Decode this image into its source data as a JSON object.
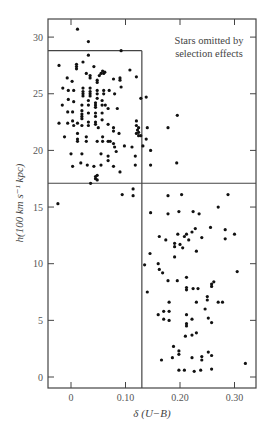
{
  "chart_data": {
    "type": "scatter",
    "title": "",
    "xlabel": "δ (U−B)",
    "ylabel": "h(100 km s⁻¹ kpc)",
    "xlim": [
      -0.042,
      0.34
    ],
    "ylim": [
      -1.0,
      31.6
    ],
    "xticks": [
      0,
      0.1,
      0.2,
      0.3
    ],
    "xtick_labels": [
      "0",
      "0.10",
      "0.20",
      "0.30"
    ],
    "yticks": [
      0,
      5,
      10,
      15,
      20,
      25,
      30
    ],
    "ytick_labels": [
      "0",
      "5",
      "10",
      "15",
      "20",
      "25",
      "30"
    ],
    "grid": false,
    "annotation": [
      "Stars omitted by",
      "selection effects"
    ],
    "boundary_lines": {
      "vertical_x": 0.13,
      "horizontal_y_mid": 17.1,
      "horizontal_y_top": 28.8,
      "top_line_extent_x": [
        -0.042,
        0.13
      ]
    },
    "points": [
      [
        0.012,
        30.7
      ],
      [
        0.032,
        29.6
      ],
      [
        0.032,
        28.4
      ],
      [
        0.092,
        28.8
      ],
      [
        -0.022,
        27.5
      ],
      [
        0.01,
        27.4
      ],
      [
        0.01,
        27.2
      ],
      [
        0.01,
        27.6
      ],
      [
        0.022,
        27.8
      ],
      [
        0.042,
        27.4
      ],
      [
        0.028,
        26.8
      ],
      [
        0.035,
        26.6
      ],
      [
        0.035,
        26.4
      ],
      [
        0.048,
        26.2
      ],
      [
        0.048,
        26.0
      ],
      [
        0.052,
        26.6
      ],
      [
        0.055,
        26.8
      ],
      [
        0.058,
        27.0
      ],
      [
        0.06,
        26.8
      ],
      [
        0.062,
        26.9
      ],
      [
        0.078,
        26.3
      ],
      [
        0.09,
        26.4
      ],
      [
        0.09,
        26.2
      ],
      [
        0.108,
        27.1
      ],
      [
        0.12,
        26.5
      ],
      [
        -0.007,
        26.4
      ],
      [
        0.002,
        26.1
      ],
      [
        -0.015,
        25.5
      ],
      [
        -0.005,
        25.3
      ],
      [
        0.005,
        25.3
      ],
      [
        0.022,
        25.5
      ],
      [
        0.022,
        25.2
      ],
      [
        0.022,
        25.0
      ],
      [
        0.022,
        24.8
      ],
      [
        0.035,
        25.5
      ],
      [
        0.035,
        25.2
      ],
      [
        0.035,
        25.0
      ],
      [
        0.035,
        24.8
      ],
      [
        0.048,
        25.3
      ],
      [
        0.048,
        25.0
      ],
      [
        0.048,
        24.6
      ],
      [
        0.06,
        25.3
      ],
      [
        0.06,
        25.0
      ],
      [
        0.07,
        25.3
      ],
      [
        0.08,
        25.0
      ],
      [
        0.092,
        25.6
      ],
      [
        0.128,
        24.6
      ],
      [
        0.138,
        24.7
      ],
      [
        -0.005,
        24.5
      ],
      [
        0.005,
        24.3
      ],
      [
        -0.016,
        24.0
      ],
      [
        0.02,
        24.0
      ],
      [
        0.032,
        24.4
      ],
      [
        0.032,
        24.0
      ],
      [
        0.045,
        24.2
      ],
      [
        0.045,
        24.0
      ],
      [
        0.045,
        23.8
      ],
      [
        0.057,
        24.4
      ],
      [
        0.057,
        24.0
      ],
      [
        0.063,
        24.0
      ],
      [
        0.068,
        23.7
      ],
      [
        0.085,
        23.7
      ],
      [
        0.003,
        23.4
      ],
      [
        -0.006,
        23.4
      ],
      [
        0.02,
        23.5
      ],
      [
        0.02,
        23.2
      ],
      [
        0.02,
        23.0
      ],
      [
        0.02,
        22.8
      ],
      [
        0.032,
        23.3
      ],
      [
        0.045,
        23.3
      ],
      [
        0.045,
        23.0
      ],
      [
        0.057,
        23.3
      ],
      [
        0.045,
        22.5
      ],
      [
        0.057,
        22.7
      ],
      [
        -0.022,
        22.4
      ],
      [
        -0.006,
        22.4
      ],
      [
        0.003,
        22.6
      ],
      [
        0.005,
        22.2
      ],
      [
        0.012,
        22.4
      ],
      [
        0.02,
        22.2
      ],
      [
        0.032,
        22.5
      ],
      [
        0.032,
        22.2
      ],
      [
        0.045,
        22.3
      ],
      [
        0.05,
        22.0
      ],
      [
        0.068,
        22.3
      ],
      [
        0.078,
        22.0
      ],
      [
        0.078,
        21.7
      ],
      [
        0.12,
        22.6
      ],
      [
        0.12,
        22.2
      ],
      [
        0.122,
        21.8
      ],
      [
        0.124,
        22.0
      ],
      [
        0.124,
        21.6
      ],
      [
        0.124,
        21.3
      ],
      [
        0.14,
        22.0
      ],
      [
        0.178,
        22.0
      ],
      [
        0.195,
        23.1
      ],
      [
        -0.012,
        21.2
      ],
      [
        0.012,
        21.5
      ],
      [
        0.012,
        21.0
      ],
      [
        0.028,
        21.2
      ],
      [
        0.058,
        21.2
      ],
      [
        0.068,
        20.8
      ],
      [
        0.078,
        20.6
      ],
      [
        0.088,
        21.5
      ],
      [
        0.12,
        21.5
      ],
      [
        0.128,
        21.3
      ],
      [
        0.138,
        21.0
      ],
      [
        0.08,
        20.3
      ],
      [
        0.112,
        20.3
      ],
      [
        0.132,
        20.4
      ],
      [
        0.012,
        20.8
      ],
      [
        0.028,
        20.8
      ],
      [
        0.048,
        20.8
      ],
      [
        0.058,
        20.8
      ],
      [
        0.072,
        20.8
      ],
      [
        0.0,
        19.7
      ],
      [
        0.02,
        19.7
      ],
      [
        0.055,
        19.7
      ],
      [
        0.068,
        19.5
      ],
      [
        0.083,
        19.9
      ],
      [
        0.098,
        20.4
      ],
      [
        0.118,
        19.5
      ],
      [
        0.118,
        18.7
      ],
      [
        0.146,
        20.0
      ],
      [
        0.146,
        18.7
      ],
      [
        0.194,
        18.9
      ],
      [
        0.003,
        18.6
      ],
      [
        0.018,
        18.9
      ],
      [
        0.03,
        18.7
      ],
      [
        0.042,
        18.6
      ],
      [
        0.055,
        18.7
      ],
      [
        0.068,
        19.1
      ],
      [
        0.078,
        18.6
      ],
      [
        0.09,
        18.1
      ],
      [
        0.045,
        17.7
      ],
      [
        0.045,
        17.5
      ],
      [
        0.048,
        17.4
      ],
      [
        0.048,
        17.8
      ],
      [
        0.036,
        17.1
      ],
      [
        0.094,
        16.1
      ],
      [
        0.114,
        16.6
      ],
      [
        0.114,
        16.0
      ],
      [
        -0.024,
        15.3
      ],
      [
        0.203,
        16.1
      ],
      [
        0.178,
        16.0
      ],
      [
        0.146,
        14.5
      ],
      [
        0.178,
        14.4
      ],
      [
        0.198,
        14.6
      ],
      [
        0.224,
        14.6
      ],
      [
        0.235,
        14.4
      ],
      [
        0.27,
        15.0
      ],
      [
        0.288,
        16.1
      ],
      [
        0.162,
        12.4
      ],
      [
        0.174,
        12.1
      ],
      [
        0.19,
        11.8
      ],
      [
        0.19,
        11.5
      ],
      [
        0.196,
        12.6
      ],
      [
        0.208,
        12.4
      ],
      [
        0.212,
        12.6
      ],
      [
        0.216,
        12.1
      ],
      [
        0.222,
        12.8
      ],
      [
        0.228,
        13.1
      ],
      [
        0.24,
        12.3
      ],
      [
        0.256,
        13.2
      ],
      [
        0.283,
        13.0
      ],
      [
        0.283,
        12.2
      ],
      [
        0.3,
        12.6
      ],
      [
        0.2,
        11.7
      ],
      [
        0.23,
        11.1
      ],
      [
        0.205,
        11.4
      ],
      [
        0.145,
        10.9
      ],
      [
        0.135,
        9.9
      ],
      [
        0.16,
        10.0
      ],
      [
        0.162,
        9.5
      ],
      [
        0.168,
        9.2
      ],
      [
        0.178,
        8.5
      ],
      [
        0.19,
        10.6
      ],
      [
        0.195,
        8.5
      ],
      [
        0.212,
        8.8
      ],
      [
        0.233,
        7.8
      ],
      [
        0.258,
        8.0
      ],
      [
        0.262,
        8.4
      ],
      [
        0.305,
        9.3
      ],
      [
        0.14,
        7.5
      ],
      [
        0.18,
        6.6
      ],
      [
        0.212,
        7.7
      ],
      [
        0.212,
        7.9
      ],
      [
        0.224,
        7.8
      ],
      [
        0.23,
        6.6
      ],
      [
        0.246,
        6.0
      ],
      [
        0.25,
        7.1
      ],
      [
        0.25,
        6.8
      ],
      [
        0.27,
        6.6
      ],
      [
        0.278,
        6.6
      ],
      [
        0.258,
        8.2
      ],
      [
        0.16,
        5.5
      ],
      [
        0.17,
        5.8
      ],
      [
        0.18,
        5.8
      ],
      [
        0.17,
        5.1
      ],
      [
        0.18,
        5.0
      ],
      [
        0.212,
        5.5
      ],
      [
        0.212,
        4.7
      ],
      [
        0.212,
        4.5
      ],
      [
        0.222,
        5.1
      ],
      [
        0.252,
        5.2
      ],
      [
        0.258,
        4.8
      ],
      [
        0.21,
        3.6
      ],
      [
        0.222,
        3.7
      ],
      [
        0.23,
        3.9
      ],
      [
        0.188,
        2.7
      ],
      [
        0.198,
        2.3
      ],
      [
        0.198,
        2.0
      ],
      [
        0.186,
        1.7
      ],
      [
        0.166,
        1.5
      ],
      [
        0.222,
        1.7
      ],
      [
        0.24,
        1.8
      ],
      [
        0.24,
        1.5
      ],
      [
        0.252,
        2.2
      ],
      [
        0.258,
        1.9
      ],
      [
        0.32,
        1.2
      ],
      [
        0.198,
        0.6
      ],
      [
        0.208,
        0.6
      ],
      [
        0.226,
        0.5
      ],
      [
        0.238,
        0.6
      ],
      [
        0.258,
        0.7
      ]
    ]
  }
}
